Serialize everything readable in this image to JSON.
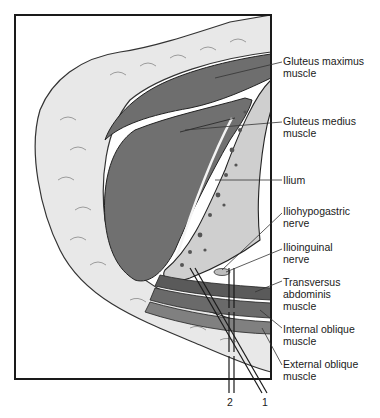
{
  "figure": {
    "type": "anatomical cross-section illustration",
    "colors": {
      "frame": "#1a1a1a",
      "fat": "#e6e6e6",
      "muscle": "#6e6e6e",
      "bone": "#c8c8c8",
      "background": "#ffffff"
    }
  },
  "labels": [
    {
      "id": "gluteus-maximus",
      "text": "Gluteus maximus\nmuscle"
    },
    {
      "id": "gluteus-medius",
      "text": "Gluteus medius\nmuscle"
    },
    {
      "id": "ilium",
      "text": "Ilium"
    },
    {
      "id": "iliohypogastric",
      "text": "Iliohypogastric\nnerve"
    },
    {
      "id": "ilioinguinal",
      "text": "Ilioinguinal\nnerve"
    },
    {
      "id": "transversus",
      "text": "Transversus\nabdominis\nmuscle"
    },
    {
      "id": "internal-oblique",
      "text": "Internal oblique\nmuscle"
    },
    {
      "id": "external-oblique",
      "text": "External oblique\nmuscle"
    }
  ],
  "needles": [
    {
      "id": "needle-1",
      "number": "1"
    },
    {
      "id": "needle-2",
      "number": "2"
    }
  ]
}
